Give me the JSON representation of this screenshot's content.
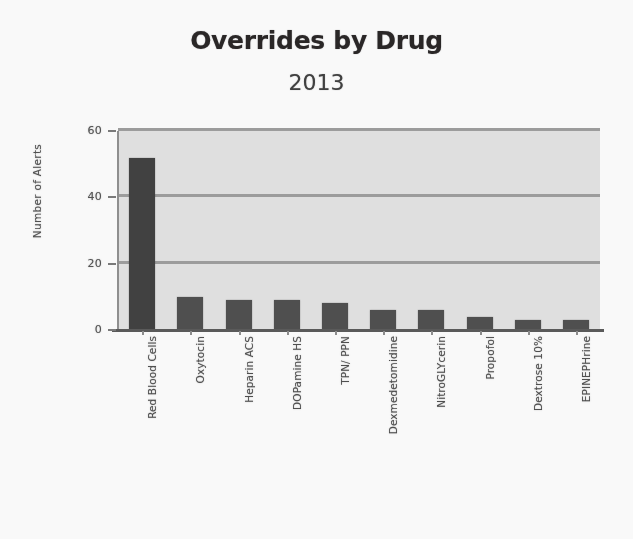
{
  "chart_data": {
    "type": "bar",
    "title": "Overrides by Drug",
    "subtitle": "2013",
    "xlabel": "",
    "ylabel": "Number of Alerts",
    "ylim": [
      0,
      60
    ],
    "yticks": [
      0,
      20,
      40,
      60
    ],
    "ytick_labels": [
      "0",
      "20",
      "40",
      "60"
    ],
    "grid": true,
    "legend": false,
    "categories": [
      "Red Blood Cells",
      "Oxytocin",
      "Heparin ACS",
      "DOPamine HS",
      "TPN/ PPN",
      "Dexmedetomidine",
      "NitroGLYcerin",
      "Propofol",
      "Dextrose 10%",
      "EPINEPHrine"
    ],
    "values": [
      52,
      10,
      9,
      9,
      8,
      6,
      6,
      4,
      3,
      3
    ],
    "bar_color": "#4a4a4a",
    "plot_background": "#e2e2e2",
    "gridline_color": "#9b9b9b"
  }
}
